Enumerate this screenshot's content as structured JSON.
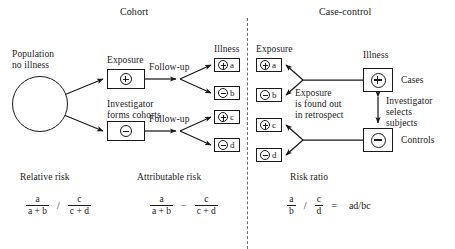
{
  "figure": {
    "panels": [
      {
        "id": "cohort",
        "title": "Cohort"
      },
      {
        "id": "case-control",
        "title": "Case-control"
      }
    ]
  },
  "cohort": {
    "title": "Cohort",
    "population_label": "Population\nno illness",
    "exposure_heading": "Exposure",
    "investigator_note": "Investigator\nforms cohorts",
    "followup_top": "Follow-up",
    "followup_bottom": "Follow-up",
    "illness_heading": "Illness",
    "exposure_groups": [
      {
        "sign": "plus"
      },
      {
        "sign": "minus"
      }
    ],
    "illness_cells": [
      {
        "sign": "plus",
        "tag": "a"
      },
      {
        "sign": "minus",
        "tag": "b"
      },
      {
        "sign": "plus",
        "tag": "c"
      },
      {
        "sign": "minus",
        "tag": "d"
      }
    ]
  },
  "case_control": {
    "title": "Case-control",
    "exposure_heading": "Exposure",
    "illness_heading": "Illness",
    "retrospect_note": "Exposure\nis found out\nin retrospect",
    "investigator_note": "Investigator\nselects\nsubjects",
    "exposure_cells": [
      {
        "sign": "plus",
        "tag": "a"
      },
      {
        "sign": "minus",
        "tag": "b"
      },
      {
        "sign": "plus",
        "tag": "c"
      },
      {
        "sign": "minus",
        "tag": "d"
      }
    ],
    "groups": [
      {
        "sign": "plus",
        "label": "Cases"
      },
      {
        "sign": "minus",
        "label": "Controls"
      }
    ]
  },
  "measures": [
    {
      "name": "relative-risk",
      "label": "Relative risk",
      "expression": [
        {
          "kind": "fraction",
          "num": "a",
          "den": "a + b"
        },
        {
          "kind": "operator",
          "text": "/"
        },
        {
          "kind": "fraction",
          "num": "c",
          "den": "c + d"
        }
      ]
    },
    {
      "name": "attributable-risk",
      "label": "Attributable risk",
      "expression": [
        {
          "kind": "fraction",
          "num": "a",
          "den": "a + b"
        },
        {
          "kind": "operator",
          "text": "−"
        },
        {
          "kind": "fraction",
          "num": "c",
          "den": "c + d"
        }
      ]
    },
    {
      "name": "risk-ratio",
      "label": "Risk ratio",
      "expression": [
        {
          "kind": "fraction",
          "num": "a",
          "den": "b"
        },
        {
          "kind": "operator",
          "text": "/"
        },
        {
          "kind": "fraction",
          "num": "c",
          "den": "d"
        },
        {
          "kind": "operator",
          "text": "="
        },
        {
          "kind": "term",
          "text": "ad/bc"
        }
      ]
    }
  ],
  "style": {
    "ink": "#1a1a1a",
    "paper": "#ffffff",
    "divider": "#6f6f6f"
  }
}
